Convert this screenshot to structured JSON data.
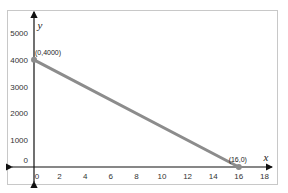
{
  "chart_data": {
    "type": "line",
    "title": "",
    "xlabel": "x",
    "ylabel": "y",
    "xlim": [
      -1,
      19
    ],
    "ylim": [
      -500,
      5300
    ],
    "x_ticks": [
      0,
      2,
      4,
      6,
      8,
      10,
      12,
      14,
      16,
      18
    ],
    "y_ticks": [
      0,
      1000,
      2000,
      3000,
      4000,
      5000
    ],
    "grid": false,
    "legend": null,
    "series": [
      {
        "name": "line",
        "color": "#8c8c8c",
        "points": [
          {
            "x": 0,
            "y": 4000,
            "label": "(0,4000)"
          },
          {
            "x": 16,
            "y": 0,
            "label": "(16,0)"
          }
        ]
      }
    ]
  }
}
